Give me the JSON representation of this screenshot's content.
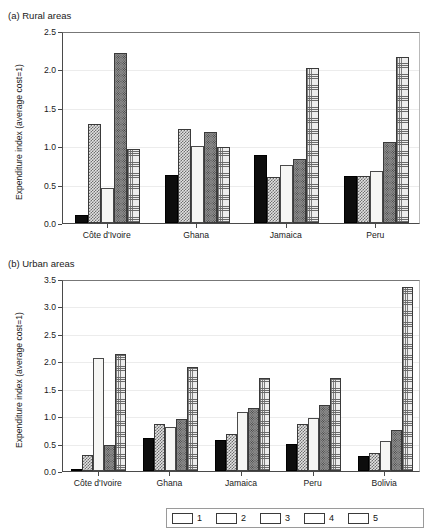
{
  "page": {
    "top_cut_text": "··························"
  },
  "panel_a": {
    "caption": "(a) Rural areas"
  },
  "panel_b": {
    "caption": "(b) Urban areas"
  },
  "legend": {
    "items": [
      {
        "label": "1",
        "pattern": "solid-black-swatch",
        "color": "#0d0d0d"
      },
      {
        "label": "2",
        "pattern": "checker-gray-swatch",
        "color": "#6f6f6f"
      },
      {
        "label": "3",
        "pattern": "white-empty-swatch",
        "color": "#f6f6f4"
      },
      {
        "label": "4",
        "pattern": "dotted-darkgray-swatch",
        "color": "#8d8d8d"
      },
      {
        "label": "5",
        "pattern": "fine-grid-swatch",
        "color": "#ededed"
      }
    ]
  },
  "chart_data": [
    {
      "type": "bar",
      "title": "(a) Rural areas",
      "xlabel": "",
      "ylabel": "Expenditure index (average cost=1)",
      "ylim": [
        0,
        2.5
      ],
      "yticks": [
        "0.0",
        "0.5",
        "1.0",
        "1.5",
        "2.0",
        "2.5"
      ],
      "ytick_values": [
        0,
        0.5,
        1.0,
        1.5,
        2.0,
        2.5
      ],
      "grid": true,
      "legend_position": "bottom-shared",
      "categories": [
        "Côte d'Ivoire",
        "Ghana",
        "Jamaica",
        "Peru"
      ],
      "series": [
        {
          "name": "1",
          "values": [
            0.11,
            0.63,
            0.89,
            0.61
          ]
        },
        {
          "name": "2",
          "values": [
            1.29,
            1.23,
            0.6,
            0.61
          ]
        },
        {
          "name": "3",
          "values": [
            0.45,
            1.0,
            0.75,
            0.68
          ]
        },
        {
          "name": "4",
          "values": [
            2.21,
            1.19,
            0.83,
            1.06
          ]
        },
        {
          "name": "5",
          "values": [
            0.96,
            0.99,
            2.02,
            2.16
          ]
        }
      ]
    },
    {
      "type": "bar",
      "title": "(b) Urban areas",
      "xlabel": "",
      "ylabel": "Expenditure index (average cost=1)",
      "ylim": [
        0,
        3.5
      ],
      "yticks": [
        "0.0",
        "0.5",
        "1.0",
        "1.5",
        "2.0",
        "2.5",
        "3.0",
        "3.5"
      ],
      "ytick_values": [
        0,
        0.5,
        1.0,
        1.5,
        2.0,
        2.5,
        3.0,
        3.5
      ],
      "grid": true,
      "legend_position": "bottom-shared",
      "categories": [
        "Côte d'Ivoire",
        "Ghana",
        "Jamaica",
        "Peru",
        "Bolivia"
      ],
      "series": [
        {
          "name": "1",
          "values": [
            0.04,
            0.6,
            0.56,
            0.49,
            0.28
          ]
        },
        {
          "name": "2",
          "values": [
            0.29,
            0.85,
            0.68,
            0.85,
            0.32
          ]
        },
        {
          "name": "3",
          "values": [
            2.06,
            0.81,
            1.07,
            0.97,
            0.55
          ]
        },
        {
          "name": "4",
          "values": [
            0.48,
            0.95,
            1.15,
            1.2,
            0.75
          ]
        },
        {
          "name": "5",
          "values": [
            2.13,
            1.89,
            1.7,
            1.7,
            3.36
          ]
        }
      ]
    }
  ]
}
